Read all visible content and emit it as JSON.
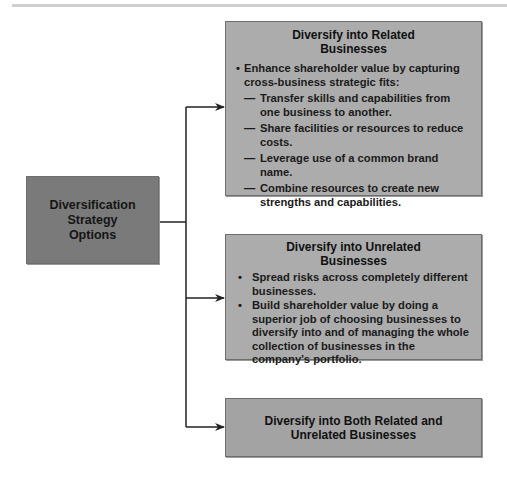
{
  "diagram": {
    "root": {
      "title": "Diversification Strategy Options"
    },
    "options": [
      {
        "title": "Diversify into Related Businesses",
        "bullets": [
          {
            "text": "Enhance shareholder value by capturing cross-business strategic fits:",
            "subpoints": [
              "Transfer skills and capabilities from one business to another.",
              "Share facilities or resources to reduce costs.",
              "Leverage use of a common brand name.",
              "Combine resources to create new strengths and capabilities."
            ]
          }
        ]
      },
      {
        "title": "Diversify into Unrelated Businesses",
        "bullets": [
          {
            "text": "Spread risks across completely different businesses."
          },
          {
            "text": "Build shareholder value by doing a superior job of choosing businesses to diversify into and of managing the whole collection of businesses in the company’s portfolio."
          }
        ]
      },
      {
        "title": "Diversify into Both Related and Unrelated Businesses"
      }
    ],
    "glyphs": {
      "bullet": "•",
      "dash": "—"
    },
    "colors": {
      "root_fill": "#7a7a7a",
      "option_fill": "#acacac",
      "connector": "#222222"
    }
  }
}
